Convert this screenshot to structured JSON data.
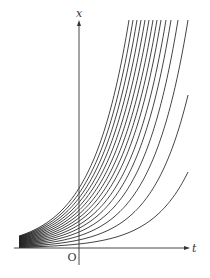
{
  "diagram": {
    "title": "",
    "axes": {
      "vertical_label": "x",
      "horizontal_label": "t",
      "origin_label": "O",
      "color": "#333333"
    },
    "curve_color": "#222222",
    "curve_family": "exponential growth curves x = c·e^(k t) for varying parameters, converging toward the t-axis as t → −∞",
    "curve_count": 15
  },
  "geometry": {
    "origin_px": [
      79,
      248
    ],
    "axis_top_px": 20,
    "axis_right_px": 186,
    "bundle_left_px": 19,
    "clip_right_px": 188,
    "curves": [
      {
        "start_offset": 12.0,
        "end": [
          129,
          20
        ]
      },
      {
        "start_offset": 11.2,
        "end": [
          133,
          20
        ]
      },
      {
        "start_offset": 10.4,
        "end": [
          137,
          20
        ]
      },
      {
        "start_offset": 9.6,
        "end": [
          141,
          20
        ]
      },
      {
        "start_offset": 8.8,
        "end": [
          145,
          20
        ]
      },
      {
        "start_offset": 8.0,
        "end": [
          149,
          20
        ]
      },
      {
        "start_offset": 7.2,
        "end": [
          153,
          20
        ]
      },
      {
        "start_offset": 6.4,
        "end": [
          157,
          20
        ]
      },
      {
        "start_offset": 5.6,
        "end": [
          161,
          20
        ]
      },
      {
        "start_offset": 4.8,
        "end": [
          166,
          20
        ]
      },
      {
        "start_offset": 4.0,
        "end": [
          171,
          20
        ]
      },
      {
        "start_offset": 3.2,
        "end": [
          178,
          20
        ]
      },
      {
        "start_offset": 2.4,
        "end": [
          188,
          20
        ]
      },
      {
        "start_offset": 1.6,
        "end": [
          188,
          95
        ]
      },
      {
        "start_offset": 0.8,
        "end": [
          188,
          172
        ]
      }
    ]
  }
}
